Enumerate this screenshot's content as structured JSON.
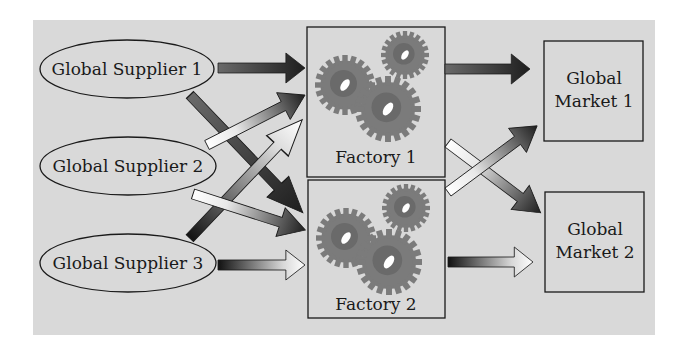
{
  "diagram": {
    "background_color": "#d9d9d9",
    "suppliers": [
      {
        "id": "s1",
        "label": "Global Supplier 1",
        "cx": 127,
        "cy": 69
      },
      {
        "id": "s2",
        "label": "Global Supplier 2",
        "cx": 128,
        "cy": 166
      },
      {
        "id": "s3",
        "label": "Global Supplier 3",
        "cx": 128,
        "cy": 263
      }
    ],
    "factories": [
      {
        "id": "f1",
        "label": "Factory 1",
        "x": 307,
        "y": 27,
        "w": 138,
        "h": 150
      },
      {
        "id": "f2",
        "label": "Factory 2",
        "x": 308,
        "y": 180,
        "w": 137,
        "h": 138
      }
    ],
    "markets": [
      {
        "id": "m1",
        "line1": "Global",
        "line2": "Market 1",
        "x": 544,
        "y": 41,
        "w": 99,
        "h": 100
      },
      {
        "id": "m2",
        "line1": "Global",
        "line2": "Market 2",
        "x": 545,
        "y": 192,
        "w": 99,
        "h": 100
      }
    ],
    "flows": [
      {
        "from": "Global Supplier 1",
        "to": "Factory 1",
        "style": "dark-filled"
      },
      {
        "from": "Global Supplier 1",
        "to": "Factory 2",
        "style": "dark-filled"
      },
      {
        "from": "Global Supplier 2",
        "to": "Factory 1",
        "style": "light-to-dark-filled"
      },
      {
        "from": "Global Supplier 2",
        "to": "Factory 2",
        "style": "light-to-dark-filled"
      },
      {
        "from": "Global Supplier 3",
        "to": "Factory 1",
        "style": "dark-to-light-hollow"
      },
      {
        "from": "Global Supplier 3",
        "to": "Factory 2",
        "style": "dark-to-light-hollow"
      },
      {
        "from": "Factory 1",
        "to": "Global Market 1",
        "style": "dark-filled"
      },
      {
        "from": "Factory 1",
        "to": "Global Market 2",
        "style": "light-to-dark-filled"
      },
      {
        "from": "Factory 2",
        "to": "Global Market 1",
        "style": "light-to-dark-filled"
      },
      {
        "from": "Factory 2",
        "to": "Global Market 2",
        "style": "dark-to-light-hollow"
      }
    ],
    "icons": {
      "factory_icon": "gears-icon"
    }
  }
}
